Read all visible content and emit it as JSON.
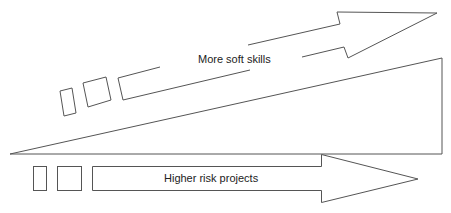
{
  "diagram": {
    "stroke_color": "#555555",
    "background": "#ffffff",
    "top_arrow": {
      "label": "More soft skills",
      "direction": "up-right"
    },
    "wedge": {
      "shape": "triangle",
      "meaning": "increasing"
    },
    "bottom_arrow": {
      "label": "Higher risk projects",
      "direction": "right"
    }
  }
}
